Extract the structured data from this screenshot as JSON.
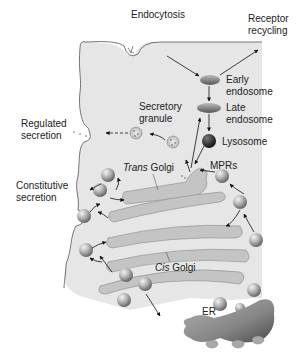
{
  "labels": {
    "endocytosis": "Endocytosis",
    "receptor_recycling_1": "Receptor",
    "receptor_recycling_2": "recycling",
    "early_endosome_1": "Early",
    "early_endosome_2": "endosome",
    "late_endosome_1": "Late",
    "late_endosome_2": "endosome",
    "secretory_granule_1": "Secretory",
    "secretory_granule_2": "granule",
    "regulated_secretion_1": "Regulated",
    "regulated_secretion_2": "secretion",
    "lysosome": "Lysosome",
    "mprs": "MPRs",
    "trans": "Trans",
    "trans_golgi": " Golgi",
    "constitutive_secretion_1": "Constitutive",
    "constitutive_secretion_2": "secretion",
    "cis": "Cis",
    "cis_golgi": " Golgi",
    "er": "ER"
  },
  "colors": {
    "cytoplasm": "#e6e6e6",
    "membrane": "#555555",
    "golgi": "#c4c4c4",
    "endosome": "#8a8a8a",
    "lysosome": "#1e1e1e",
    "er": "#8c8c8c",
    "vesicle": "#9a9a9a"
  }
}
